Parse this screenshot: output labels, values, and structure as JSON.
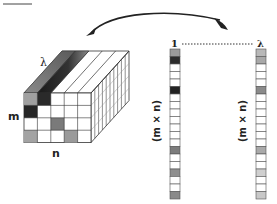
{
  "diagram": {
    "cube": {
      "depth_label": "λ",
      "rows_label": "m",
      "cols_label": "n",
      "front_grid": {
        "rows": 4,
        "cols": 5,
        "shaded_cells": [
          {
            "row": 0,
            "col": 0,
            "color": "#a0a0a0"
          },
          {
            "row": 0,
            "col": 1,
            "color": "#2a2a2a"
          },
          {
            "row": 1,
            "col": 0,
            "color": "#262626"
          },
          {
            "row": 2,
            "col": 2,
            "color": "#7a7a7a"
          },
          {
            "row": 3,
            "col": 0,
            "color": "#a3a3a3"
          },
          {
            "row": 3,
            "col": 3,
            "color": "#9a9a9a"
          }
        ]
      },
      "depth_slices": 10
    },
    "arrow": {
      "direction": "cube-to-vectors"
    },
    "vectors": {
      "dotted_connector": true,
      "left": {
        "top_label": "1",
        "size_label": "(m × n)",
        "cell_count": 20,
        "colors": [
          "#9a9a9a",
          "#2c2c2c",
          "#ffffff",
          "#ffffff",
          "#ffffff",
          "#222222",
          "#ffffff",
          "#ffffff",
          "#ffffff",
          "#ffffff",
          "#ffffff",
          "#ffffff",
          "#ffffff",
          "#7c7c7c",
          "#ffffff",
          "#ffffff",
          "#8f8f8f",
          "#ffffff",
          "#ffffff",
          "#8a8a8a"
        ]
      },
      "right": {
        "top_label": "λ",
        "size_label": "(m × n)",
        "cell_count": 20,
        "colors": [
          "#b8b8b8",
          "#a8a8a8",
          "#ffffff",
          "#ffffff",
          "#ffffff",
          "#8a8a8a",
          "#ffffff",
          "#ffffff",
          "#ffffff",
          "#ffffff",
          "#ffffff",
          "#ffffff",
          "#ffffff",
          "#a9a9a9",
          "#ffffff",
          "#ffffff",
          "#cfcfcf",
          "#ffffff",
          "#ffffff",
          "#c8c8c8"
        ]
      }
    }
  }
}
